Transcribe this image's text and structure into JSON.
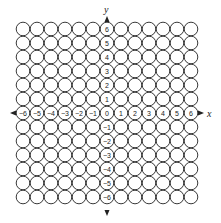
{
  "diagram": {
    "title": "",
    "x_axis_label": "x",
    "y_axis_label": "y",
    "grid": {
      "rows": 13,
      "cols": 13,
      "min": -6,
      "max": 6
    },
    "x_labels": [
      "-6",
      "-5",
      "-4",
      "-3",
      "-2",
      "-1",
      "0",
      "1",
      "2",
      "3",
      "4",
      "5",
      "6"
    ],
    "y_labels": [
      "6",
      "5",
      "4",
      "3",
      "2",
      "1",
      "",
      "-1",
      "-2",
      "-3",
      "-4",
      "-5",
      "-6"
    ],
    "colors": {
      "stroke": "#222222",
      "background": "#ffffff"
    }
  }
}
